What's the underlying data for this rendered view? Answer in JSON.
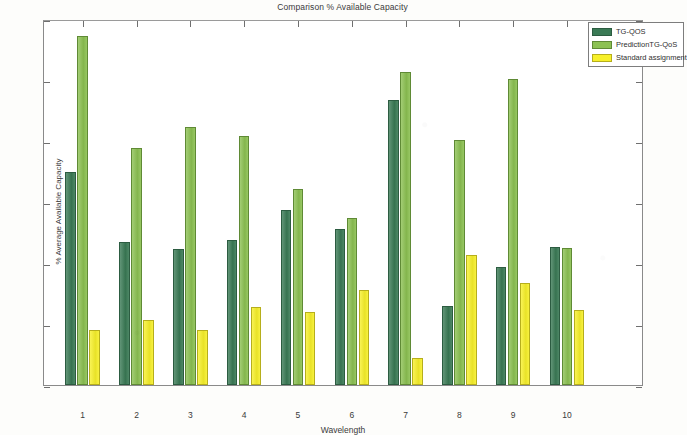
{
  "chart_data": {
    "type": "bar",
    "title": "Comparison % Available Capacity",
    "xlabel": "Wavelength",
    "ylabel": "% Average Available Capacity",
    "categories": [
      "1",
      "2",
      "3",
      "4",
      "5",
      "6",
      "7",
      "8",
      "9",
      "10"
    ],
    "ylim": [
      0,
      60
    ],
    "yticks": [
      0,
      10,
      20,
      30,
      40,
      50,
      60
    ],
    "grid": false,
    "legend_position": "top-right",
    "series": [
      {
        "name": "TG-QOS",
        "color": "#3a7a55",
        "values": [
          34.9,
          23.5,
          22.3,
          23.7,
          28.7,
          25.6,
          46.8,
          13.0,
          19.4,
          22.7
        ]
      },
      {
        "name": "PredictionTG-QoS",
        "color": "#8cc152",
        "values": [
          57.2,
          38.8,
          42.3,
          40.8,
          32.1,
          27.4,
          51.3,
          40.1,
          50.2,
          22.4
        ]
      },
      {
        "name": "Standard assignment",
        "color": "#f7f02a",
        "values": [
          9.1,
          10.7,
          9.0,
          12.8,
          11.9,
          15.5,
          4.5,
          21.3,
          16.8,
          12.3
        ]
      }
    ]
  },
  "legend": {
    "entries": [
      {
        "label": "TG-QOS"
      },
      {
        "label": "PredictionTG-QoS"
      },
      {
        "label": "Standard assignment"
      }
    ]
  }
}
